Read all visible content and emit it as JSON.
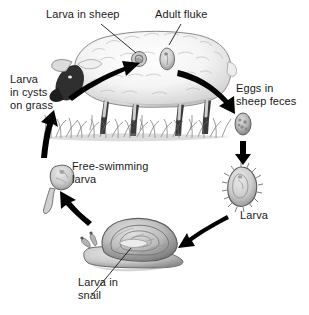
{
  "figure": {
    "background_color": "#ffffff",
    "text_color": "#1a1a1a",
    "ink_color": "#000000"
  },
  "labels": {
    "larva_in_sheep": "Larva in sheep",
    "adult_fluke": "Adult fluke",
    "larva_in_cysts_on_grass": "Larva\nin cysts\non grass",
    "eggs_in_sheep_feces": "Eggs in\nsheep feces",
    "larva": "Larva",
    "free_swimming_larva": "Free-swimming\nlarva",
    "larva_in_snail": "Larva in\nsnail"
  },
  "organisms": [
    {
      "name": "sheep",
      "description": "Sheep with dark face and legs standing on grass, facing left"
    },
    {
      "name": "adult-fluke",
      "description": "Leaf-shaped adult fluke inside sheep body"
    },
    {
      "name": "larva-in-sheep",
      "description": "Round encysted larva inside sheep body"
    },
    {
      "name": "egg",
      "description": "Oval fluke egg in sheep feces"
    },
    {
      "name": "miracidium-larva",
      "description": "Teardrop-shaped ciliated larva with fringe of cilia"
    },
    {
      "name": "snail",
      "description": "Snail with spiral shell containing developing larva"
    },
    {
      "name": "cercaria-larva",
      "description": "Free-swimming larva with body and long tail"
    },
    {
      "name": "grass",
      "description": "Tuft of grass bearing encysted larvae"
    }
  ],
  "arrows": [
    {
      "name": "arrow-larva-to-adult",
      "from": "larva in sheep",
      "to": "adult fluke"
    },
    {
      "name": "arrow-sheep-to-eggs",
      "from": "sheep",
      "to": "eggs in sheep feces"
    },
    {
      "name": "arrow-eggs-to-larva",
      "from": "eggs",
      "to": "larva"
    },
    {
      "name": "arrow-larva-to-snail",
      "from": "larva",
      "to": "snail"
    },
    {
      "name": "arrow-snail-to-cercaria",
      "from": "snail",
      "to": "free-swimming larva"
    },
    {
      "name": "arrow-cercaria-to-grass",
      "from": "free-swimming larva",
      "to": "larva in cysts on grass"
    }
  ]
}
